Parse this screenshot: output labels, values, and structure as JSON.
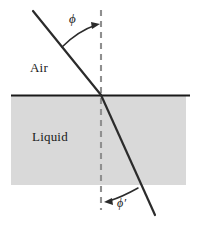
{
  "figure": {
    "labels": {
      "air": "Air",
      "liquid": "Liquid",
      "incident_angle": "ϕ",
      "refracted_angle": "ϕ′"
    },
    "colors": {
      "background": "#ffffff",
      "liquid_fill": "#d9d9d9",
      "ray": "#2b2b2b",
      "interface": "#1a1a1a",
      "normal_dash": "#9a9a9a",
      "text": "#1a1a1a"
    },
    "geometry": {
      "interface_y": 95,
      "interface_x_start": 11,
      "interface_x_end": 190,
      "liquid_top": 96,
      "liquid_bottom": 185,
      "normal_x": 101,
      "normal_y_start": 10,
      "normal_y_end": 210,
      "origin_x": 101,
      "origin_y": 95,
      "incident_start_x": 33,
      "incident_start_y": 11,
      "refracted_end_x": 155,
      "refracted_end_y": 215,
      "incident_angle_deg": 39,
      "refracted_angle_deg": 24
    },
    "elements": {
      "incident_ray": "incident-ray",
      "refracted_ray": "refracted-ray",
      "normal_line": "normal-dashed-line",
      "interface_line": "interface-line",
      "liquid_region": "liquid-region",
      "air_region": "air-region",
      "incident_arc": "incident-angle-arc",
      "refracted_arc": "refracted-angle-arc"
    }
  }
}
